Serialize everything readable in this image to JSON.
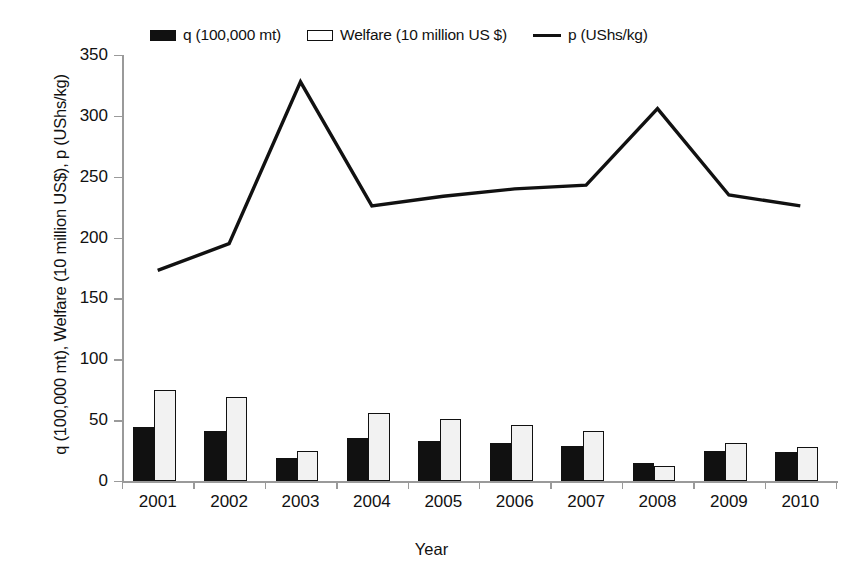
{
  "chart_data": {
    "type": "bar",
    "title": "",
    "xlabel": "Year",
    "ylabel": "q (100,000 mt), Welfare (10 million US$), p (UShs/kg)",
    "categories": [
      "2001",
      "2002",
      "2003",
      "2004",
      "2005",
      "2006",
      "2007",
      "2008",
      "2009",
      "2010"
    ],
    "ylim": [
      0,
      350
    ],
    "yticks": [
      0,
      50,
      100,
      150,
      200,
      250,
      300,
      350
    ],
    "grid": false,
    "legend_position": "top",
    "series": [
      {
        "name": "q (100,000 mt)",
        "render": "bar",
        "color": "#111111",
        "fill": "solid",
        "values": [
          44,
          41,
          19,
          35,
          33,
          31,
          29,
          15,
          25,
          24
        ]
      },
      {
        "name": "Welfare (10 million US $)",
        "render": "bar",
        "color": "#111111",
        "fill": "open",
        "values": [
          75,
          69,
          25,
          56,
          51,
          46,
          41,
          12,
          31,
          28
        ]
      },
      {
        "name": "p (UShs/kg)",
        "render": "line",
        "color": "#111111",
        "values": [
          173,
          195,
          328,
          226,
          234,
          240,
          243,
          306,
          235,
          226
        ]
      }
    ]
  },
  "legend": {
    "items": [
      {
        "label": "q (100,000 mt)",
        "marker": "filled-square"
      },
      {
        "label": "Welfare (10 million US $)",
        "marker": "open-square"
      },
      {
        "label": "p (UShs/kg)",
        "marker": "line"
      }
    ]
  },
  "axes": {
    "y_title": "q (100,000 mt), Welfare (10 million US$), p (UShs/kg)",
    "x_title": "Year",
    "y_tick_labels": [
      "350",
      "300",
      "250",
      "200",
      "150",
      "100",
      "50",
      "0"
    ],
    "x_tick_labels": [
      "2001",
      "2002",
      "2003",
      "2004",
      "2005",
      "2006",
      "2007",
      "2008",
      "2009",
      "2010"
    ]
  }
}
